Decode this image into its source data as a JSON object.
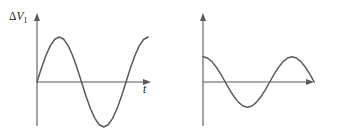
{
  "figure": {
    "background": "#ffffff",
    "stroke_color": "#5a5a5a",
    "text_color": "#1c1c1c",
    "width": 337,
    "height": 137
  },
  "panels": [
    {
      "name": "left-panel",
      "y_axis_label_delta": "Δ",
      "y_axis_label_symbol": "V",
      "y_axis_label_subscript": "1",
      "x_axis_label": "t"
    },
    {
      "name": "right-panel",
      "y_axis_label_delta": "Δ",
      "y_axis_label_symbol": "V",
      "y_axis_label_subscript": "2",
      "x_axis_label": "t"
    }
  ],
  "chart_data": [
    {
      "type": "line",
      "name": "delta-v1-waveform",
      "title": "",
      "xlabel": "t",
      "ylabel": "ΔV₁",
      "grid": false,
      "legend": null,
      "axis_arrows": true,
      "waveform": "sine",
      "phase_deg": 0,
      "amplitude": 1.0,
      "cycles_shown": 1.25,
      "zero_crossings_t": [
        0,
        0.5,
        1.0
      ],
      "peak_t": 0.25,
      "trough_t": 0.75,
      "xlim": [
        -0.07,
        1.33
      ],
      "ylim": [
        -1.35,
        1.35
      ],
      "x": [
        0,
        0.05,
        0.1,
        0.15,
        0.2,
        0.25,
        0.3,
        0.35,
        0.4,
        0.45,
        0.5,
        0.55,
        0.6,
        0.65,
        0.7,
        0.75,
        0.8,
        0.85,
        0.9,
        0.95,
        1.0,
        1.05,
        1.1,
        1.15,
        1.2,
        1.25
      ],
      "y": [
        0,
        0.309,
        0.588,
        0.809,
        0.951,
        1.0,
        0.951,
        0.809,
        0.588,
        0.309,
        0,
        -0.309,
        -0.588,
        -0.809,
        -0.951,
        -1.0,
        -0.951,
        -0.809,
        -0.588,
        -0.309,
        0,
        0.309,
        0.588,
        0.809,
        0.951,
        1.0
      ]
    },
    {
      "type": "line",
      "name": "delta-v2-waveform",
      "title": "",
      "xlabel": "t",
      "ylabel": "ΔV₂",
      "grid": false,
      "legend": null,
      "axis_arrows": true,
      "waveform": "cosine",
      "phase_deg": 90,
      "amplitude": 0.56,
      "cycles_shown": 1.25,
      "zero_crossings_t": [
        0.25,
        0.75,
        1.25
      ],
      "peak_t": 0.0,
      "trough_t": 0.5,
      "xlim": [
        -0.07,
        1.33
      ],
      "ylim": [
        -1.35,
        1.35
      ],
      "x": [
        0,
        0.05,
        0.1,
        0.15,
        0.2,
        0.25,
        0.3,
        0.35,
        0.4,
        0.45,
        0.5,
        0.55,
        0.6,
        0.65,
        0.7,
        0.75,
        0.8,
        0.85,
        0.9,
        0.95,
        1.0,
        1.05,
        1.1,
        1.15,
        1.2,
        1.25
      ],
      "y": [
        0.56,
        0.533,
        0.453,
        0.329,
        0.173,
        0,
        -0.173,
        -0.329,
        -0.453,
        -0.533,
        -0.56,
        -0.533,
        -0.453,
        -0.329,
        -0.173,
        0,
        0.173,
        0.329,
        0.453,
        0.533,
        0.56,
        0.533,
        0.453,
        0.329,
        0.173,
        0
      ]
    }
  ]
}
